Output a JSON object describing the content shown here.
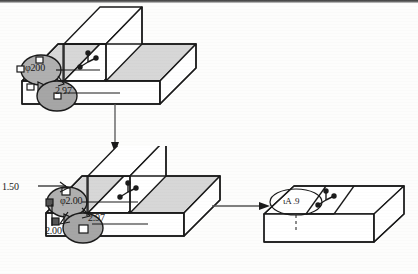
{
  "figure": {
    "kind": "cad-modeling-sequence",
    "background_color": "#fdfdfc",
    "line_color": "#1a1a1a",
    "shade_color": "#d5d5d5",
    "cylinder_color": "#9a9a9a",
    "page_edge_color": "#3a3a3a"
  },
  "steps": [
    {
      "id": "step-1",
      "name": "top-block-with-bosses",
      "labels": [
        {
          "name": "diameter-200",
          "text": "φ200",
          "x": 25,
          "y": 62
        },
        {
          "name": "depth-297",
          "text": "2.97",
          "x": 55,
          "y": 85
        }
      ],
      "handle_count": 3,
      "triad": {
        "name": "axis-triad",
        "x": 88,
        "y": 62
      }
    },
    {
      "id": "step-2",
      "name": "middle-block-with-bosses",
      "labels": [
        {
          "name": "offset-150",
          "text": "1.50",
          "x": 3,
          "y": 181
        },
        {
          "name": "diameter-200",
          "text": "φ2.00",
          "x": 60,
          "y": 195
        },
        {
          "name": "depth-297",
          "text": "2.97",
          "x": 88,
          "y": 212
        },
        {
          "name": "offset-200",
          "text": "2.00",
          "x": 45,
          "y": 225
        }
      ],
      "handle_count": 3,
      "triad": {
        "name": "axis-triad",
        "x": 128,
        "y": 190
      }
    },
    {
      "id": "step-3",
      "name": "result-block-with-slot",
      "labels": [
        {
          "name": "feature-callout",
          "text": "ιA  .9",
          "x": 283,
          "y": 203
        }
      ],
      "handle_count": 3,
      "triad": {
        "name": "axis-triad",
        "x": 325,
        "y": 200
      }
    }
  ],
  "connectors": [
    {
      "name": "connector-step1-to-step2",
      "type": "arrow-down",
      "from": "step-1",
      "to": "step-2"
    },
    {
      "name": "connector-step2-to-step3",
      "type": "arrow-right",
      "from": "step-2",
      "to": "step-3"
    }
  ]
}
